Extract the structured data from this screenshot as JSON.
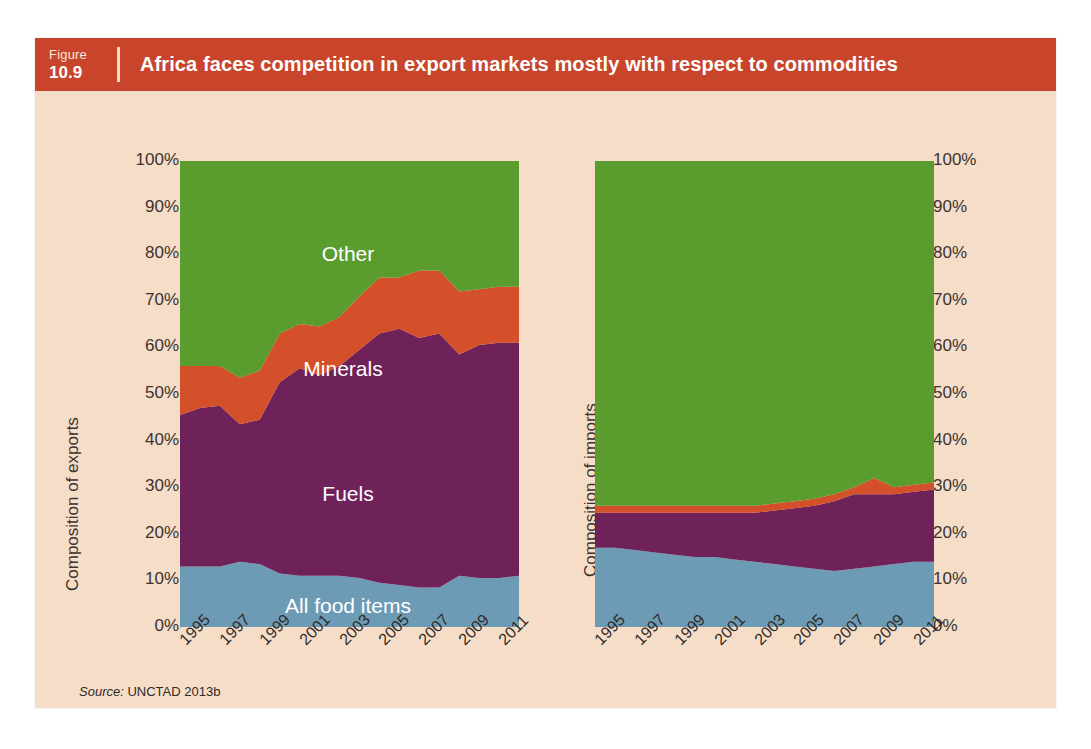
{
  "figure": {
    "label": "Figure",
    "number": "10.9",
    "title": "Africa faces competition in export markets mostly with respect to commodities",
    "source_label": "Source:",
    "source_text": "UNCTAD 2013b",
    "header_color": "#c8452b",
    "background_color": "#f6ddc8"
  },
  "axes": {
    "left_title": "Composition of exports",
    "right_title": "Composition of imports",
    "yticks": [
      "100%",
      "90%",
      "80%",
      "70%",
      "60%",
      "50%",
      "40%",
      "30%",
      "20%",
      "10%",
      "0%"
    ],
    "xticks": [
      "1995",
      "1997",
      "1999",
      "2001",
      "2003",
      "2005",
      "2007",
      "2009",
      "2011"
    ]
  },
  "series_labels": {
    "other": "Other",
    "minerals": "Minerals",
    "fuels": "Fuels",
    "food": "All food items"
  },
  "colors": {
    "food": "#6d9bb5",
    "fuels": "#6e2259",
    "minerals": "#d4502a",
    "other": "#5a9c2e"
  },
  "chart_data": [
    {
      "type": "area",
      "id": "exports",
      "title": "Composition of exports",
      "stacked": true,
      "percent": true,
      "xlabel": "",
      "ylabel": "Composition of exports",
      "ylim": [
        0,
        100
      ],
      "grid": false,
      "legend": "inline-labels",
      "x": [
        1995,
        1996,
        1997,
        1998,
        1999,
        2000,
        2001,
        2002,
        2003,
        2004,
        2005,
        2006,
        2007,
        2008,
        2009,
        2010,
        2011,
        2012
      ],
      "tick_x": [
        1995,
        1997,
        1999,
        2001,
        2003,
        2005,
        2007,
        2009,
        2011
      ],
      "series": [
        {
          "name": "All food items",
          "color": "#6d9bb5",
          "values": [
            13,
            13,
            13,
            14,
            13.5,
            11.5,
            11,
            11,
            11,
            10.5,
            9.5,
            9,
            8.5,
            8.5,
            11,
            10.5,
            10.5,
            11
          ]
        },
        {
          "name": "Fuels",
          "color": "#6e2259",
          "values": [
            32.5,
            34,
            34.5,
            29.5,
            31,
            41,
            44.5,
            43,
            45,
            49,
            53.5,
            55,
            53.5,
            54.5,
            47.5,
            50,
            50.5,
            50
          ]
        },
        {
          "name": "Minerals",
          "color": "#d4502a",
          "values": [
            10.5,
            9,
            8.5,
            10,
            10.5,
            10.5,
            9.5,
            10.5,
            10.5,
            11.5,
            12,
            11,
            14.5,
            13.5,
            13.5,
            12,
            12,
            12
          ]
        },
        {
          "name": "Other",
          "color": "#5a9c2e",
          "values": [
            44,
            44,
            44,
            46.5,
            45,
            37,
            35,
            35.5,
            33.5,
            29,
            25,
            25,
            23.5,
            23.5,
            28,
            27.5,
            27,
            27
          ]
        }
      ]
    },
    {
      "type": "area",
      "id": "imports",
      "title": "Composition of imports",
      "stacked": true,
      "percent": true,
      "xlabel": "",
      "ylabel": "Composition of imports",
      "ylim": [
        0,
        100
      ],
      "grid": false,
      "legend": "none",
      "x": [
        1995,
        1996,
        1997,
        1998,
        1999,
        2000,
        2001,
        2002,
        2003,
        2004,
        2005,
        2006,
        2007,
        2008,
        2009,
        2010,
        2011,
        2012
      ],
      "tick_x": [
        1995,
        1997,
        1999,
        2001,
        2003,
        2005,
        2007,
        2009,
        2011
      ],
      "series": [
        {
          "name": "All food items",
          "color": "#6d9bb5",
          "values": [
            17,
            17,
            16.5,
            16,
            15.5,
            15,
            15,
            14.5,
            14,
            13.5,
            13,
            12.5,
            12,
            12.5,
            13,
            13.5,
            14,
            14
          ]
        },
        {
          "name": "Fuels",
          "color": "#6e2259",
          "values": [
            7.5,
            7.5,
            8,
            8.5,
            9,
            9.5,
            9.5,
            10,
            10.5,
            11.5,
            12.5,
            13.5,
            15,
            16,
            15.5,
            15,
            15,
            15.5
          ]
        },
        {
          "name": "Minerals",
          "color": "#d4502a",
          "values": [
            1.5,
            1.5,
            1.5,
            1.5,
            1.5,
            1.5,
            1.5,
            1.5,
            1.5,
            1.5,
            1.5,
            1.5,
            1.5,
            1.5,
            3.5,
            1.5,
            1.5,
            1.5
          ]
        },
        {
          "name": "Other",
          "color": "#5a9c2e",
          "values": [
            74,
            74,
            74,
            74,
            74,
            74,
            74,
            74,
            74,
            73.5,
            73,
            72.5,
            71.5,
            70,
            68,
            70,
            69.5,
            69
          ]
        }
      ]
    }
  ]
}
